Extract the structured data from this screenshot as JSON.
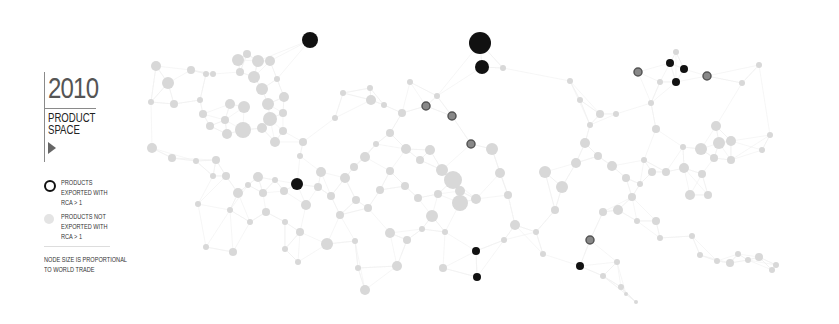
{
  "panel": {
    "year": "2010",
    "title": "PRODUCT\nSPACE",
    "play_icon": "play-triangle-icon"
  },
  "legend": {
    "items": [
      {
        "label": "PRODUCTS\nEXPORTED WITH\nRCA > 1",
        "style": "dark-ring"
      },
      {
        "label": "PRODUCTS NOT\nEXPORTED WITH\nRCA > 1",
        "style": "light-dot"
      }
    ],
    "note": "NODE SIZE IS PROPORTIONAL\nTO WORLD TRADE"
  },
  "colors": {
    "exported": "#111111",
    "exported_mid": "#555555",
    "not_exported": "#d8d8d8",
    "edge": "#f0f0f0",
    "text": "#333333"
  },
  "graph": {
    "exported_nodes": [
      {
        "x": 310,
        "y": 40,
        "r": 8
      },
      {
        "x": 480,
        "y": 43,
        "r": 11
      },
      {
        "x": 482,
        "y": 67,
        "r": 7
      },
      {
        "x": 670,
        "y": 63,
        "r": 4
      },
      {
        "x": 684,
        "y": 69,
        "r": 4
      },
      {
        "x": 676,
        "y": 82,
        "r": 4
      },
      {
        "x": 297,
        "y": 184,
        "r": 6
      },
      {
        "x": 476,
        "y": 251,
        "r": 4
      },
      {
        "x": 477,
        "y": 277,
        "r": 4
      },
      {
        "x": 580,
        "y": 266,
        "r": 4
      }
    ],
    "ring_nodes": [
      {
        "x": 638,
        "y": 72,
        "r": 4
      },
      {
        "x": 707,
        "y": 76,
        "r": 4
      },
      {
        "x": 426,
        "y": 106,
        "r": 4
      },
      {
        "x": 452,
        "y": 116,
        "r": 4
      },
      {
        "x": 471,
        "y": 144,
        "r": 4
      },
      {
        "x": 590,
        "y": 240,
        "r": 4
      }
    ],
    "light_nodes": [
      {
        "x": 156,
        "y": 66,
        "r": 5
      },
      {
        "x": 168,
        "y": 83,
        "r": 6
      },
      {
        "x": 191,
        "y": 70,
        "r": 4
      },
      {
        "x": 206,
        "y": 74,
        "r": 3
      },
      {
        "x": 213,
        "y": 74,
        "r": 3
      },
      {
        "x": 238,
        "y": 60,
        "r": 6
      },
      {
        "x": 247,
        "y": 54,
        "r": 4
      },
      {
        "x": 258,
        "y": 61,
        "r": 6
      },
      {
        "x": 270,
        "y": 61,
        "r": 5
      },
      {
        "x": 240,
        "y": 72,
        "r": 4
      },
      {
        "x": 254,
        "y": 77,
        "r": 6
      },
      {
        "x": 262,
        "y": 89,
        "r": 6
      },
      {
        "x": 277,
        "y": 79,
        "r": 3
      },
      {
        "x": 284,
        "y": 97,
        "r": 5
      },
      {
        "x": 230,
        "y": 104,
        "r": 5
      },
      {
        "x": 244,
        "y": 107,
        "r": 6
      },
      {
        "x": 268,
        "y": 104,
        "r": 6
      },
      {
        "x": 270,
        "y": 119,
        "r": 7
      },
      {
        "x": 283,
        "y": 113,
        "r": 4
      },
      {
        "x": 225,
        "y": 120,
        "r": 4
      },
      {
        "x": 243,
        "y": 130,
        "r": 8
      },
      {
        "x": 262,
        "y": 128,
        "r": 5
      },
      {
        "x": 227,
        "y": 134,
        "r": 5
      },
      {
        "x": 283,
        "y": 131,
        "r": 4
      },
      {
        "x": 275,
        "y": 142,
        "r": 5
      },
      {
        "x": 200,
        "y": 100,
        "r": 3
      },
      {
        "x": 174,
        "y": 104,
        "r": 4
      },
      {
        "x": 151,
        "y": 102,
        "r": 3
      },
      {
        "x": 152,
        "y": 148,
        "r": 5
      },
      {
        "x": 172,
        "y": 158,
        "r": 4
      },
      {
        "x": 203,
        "y": 114,
        "r": 4
      },
      {
        "x": 210,
        "y": 126,
        "r": 4
      },
      {
        "x": 196,
        "y": 161,
        "r": 3
      },
      {
        "x": 213,
        "y": 176,
        "r": 3
      },
      {
        "x": 216,
        "y": 160,
        "r": 4
      },
      {
        "x": 226,
        "y": 176,
        "r": 4
      },
      {
        "x": 238,
        "y": 193,
        "r": 5
      },
      {
        "x": 248,
        "y": 185,
        "r": 3
      },
      {
        "x": 258,
        "y": 177,
        "r": 5
      },
      {
        "x": 263,
        "y": 193,
        "r": 4
      },
      {
        "x": 275,
        "y": 180,
        "r": 3
      },
      {
        "x": 284,
        "y": 191,
        "r": 4
      },
      {
        "x": 306,
        "y": 205,
        "r": 5
      },
      {
        "x": 318,
        "y": 187,
        "r": 4
      },
      {
        "x": 321,
        "y": 172,
        "r": 5
      },
      {
        "x": 331,
        "y": 196,
        "r": 4
      },
      {
        "x": 345,
        "y": 178,
        "r": 5
      },
      {
        "x": 354,
        "y": 167,
        "r": 4
      },
      {
        "x": 365,
        "y": 157,
        "r": 5
      },
      {
        "x": 376,
        "y": 144,
        "r": 3
      },
      {
        "x": 371,
        "y": 100,
        "r": 5
      },
      {
        "x": 384,
        "y": 105,
        "r": 3
      },
      {
        "x": 402,
        "y": 113,
        "r": 4
      },
      {
        "x": 390,
        "y": 133,
        "r": 4
      },
      {
        "x": 406,
        "y": 149,
        "r": 5
      },
      {
        "x": 420,
        "y": 160,
        "r": 4
      },
      {
        "x": 430,
        "y": 150,
        "r": 5
      },
      {
        "x": 442,
        "y": 170,
        "r": 6
      },
      {
        "x": 453,
        "y": 180,
        "r": 9
      },
      {
        "x": 460,
        "y": 191,
        "r": 5
      },
      {
        "x": 460,
        "y": 203,
        "r": 8
      },
      {
        "x": 476,
        "y": 199,
        "r": 5
      },
      {
        "x": 492,
        "y": 149,
        "r": 6
      },
      {
        "x": 500,
        "y": 173,
        "r": 5
      },
      {
        "x": 508,
        "y": 195,
        "r": 4
      },
      {
        "x": 515,
        "y": 225,
        "r": 5
      },
      {
        "x": 438,
        "y": 194,
        "r": 4
      },
      {
        "x": 432,
        "y": 216,
        "r": 6
      },
      {
        "x": 418,
        "y": 198,
        "r": 4
      },
      {
        "x": 405,
        "y": 186,
        "r": 4
      },
      {
        "x": 390,
        "y": 171,
        "r": 4
      },
      {
        "x": 380,
        "y": 190,
        "r": 4
      },
      {
        "x": 368,
        "y": 208,
        "r": 4
      },
      {
        "x": 356,
        "y": 200,
        "r": 4
      },
      {
        "x": 340,
        "y": 215,
        "r": 4
      },
      {
        "x": 327,
        "y": 244,
        "r": 6
      },
      {
        "x": 300,
        "y": 232,
        "r": 4
      },
      {
        "x": 285,
        "y": 222,
        "r": 3
      },
      {
        "x": 266,
        "y": 212,
        "r": 4
      },
      {
        "x": 250,
        "y": 222,
        "r": 3
      },
      {
        "x": 230,
        "y": 210,
        "r": 3
      },
      {
        "x": 198,
        "y": 204,
        "r": 3
      },
      {
        "x": 206,
        "y": 247,
        "r": 3
      },
      {
        "x": 233,
        "y": 252,
        "r": 4
      },
      {
        "x": 285,
        "y": 249,
        "r": 3
      },
      {
        "x": 298,
        "y": 262,
        "r": 3
      },
      {
        "x": 355,
        "y": 241,
        "r": 3
      },
      {
        "x": 390,
        "y": 233,
        "r": 5
      },
      {
        "x": 407,
        "y": 240,
        "r": 4
      },
      {
        "x": 422,
        "y": 229,
        "r": 3
      },
      {
        "x": 445,
        "y": 232,
        "r": 3
      },
      {
        "x": 397,
        "y": 266,
        "r": 5
      },
      {
        "x": 365,
        "y": 290,
        "r": 5
      },
      {
        "x": 358,
        "y": 268,
        "r": 3
      },
      {
        "x": 443,
        "y": 268,
        "r": 4
      },
      {
        "x": 504,
        "y": 240,
        "r": 3
      },
      {
        "x": 536,
        "y": 232,
        "r": 3
      },
      {
        "x": 543,
        "y": 254,
        "r": 3
      },
      {
        "x": 555,
        "y": 210,
        "r": 4
      },
      {
        "x": 545,
        "y": 172,
        "r": 6
      },
      {
        "x": 562,
        "y": 187,
        "r": 6
      },
      {
        "x": 576,
        "y": 163,
        "r": 5
      },
      {
        "x": 585,
        "y": 143,
        "r": 5
      },
      {
        "x": 598,
        "y": 156,
        "r": 4
      },
      {
        "x": 612,
        "y": 166,
        "r": 5
      },
      {
        "x": 626,
        "y": 178,
        "r": 4
      },
      {
        "x": 632,
        "y": 197,
        "r": 4
      },
      {
        "x": 640,
        "y": 184,
        "r": 3
      },
      {
        "x": 644,
        "y": 160,
        "r": 3
      },
      {
        "x": 652,
        "y": 172,
        "r": 4
      },
      {
        "x": 666,
        "y": 172,
        "r": 4
      },
      {
        "x": 684,
        "y": 168,
        "r": 5
      },
      {
        "x": 702,
        "y": 174,
        "r": 4
      },
      {
        "x": 701,
        "y": 149,
        "r": 6
      },
      {
        "x": 716,
        "y": 126,
        "r": 5
      },
      {
        "x": 719,
        "y": 143,
        "r": 6
      },
      {
        "x": 731,
        "y": 141,
        "r": 5
      },
      {
        "x": 714,
        "y": 158,
        "r": 4
      },
      {
        "x": 731,
        "y": 160,
        "r": 4
      },
      {
        "x": 708,
        "y": 195,
        "r": 4
      },
      {
        "x": 690,
        "y": 195,
        "r": 5
      },
      {
        "x": 683,
        "y": 147,
        "r": 3
      },
      {
        "x": 656,
        "y": 129,
        "r": 4
      },
      {
        "x": 603,
        "y": 212,
        "r": 4
      },
      {
        "x": 618,
        "y": 210,
        "r": 5
      },
      {
        "x": 637,
        "y": 221,
        "r": 3
      },
      {
        "x": 656,
        "y": 221,
        "r": 4
      },
      {
        "x": 660,
        "y": 238,
        "r": 3
      },
      {
        "x": 692,
        "y": 236,
        "r": 3
      },
      {
        "x": 700,
        "y": 255,
        "r": 3
      },
      {
        "x": 717,
        "y": 261,
        "r": 3
      },
      {
        "x": 730,
        "y": 263,
        "r": 4
      },
      {
        "x": 738,
        "y": 254,
        "r": 3
      },
      {
        "x": 748,
        "y": 260,
        "r": 3
      },
      {
        "x": 759,
        "y": 257,
        "r": 4
      },
      {
        "x": 776,
        "y": 265,
        "r": 3
      },
      {
        "x": 772,
        "y": 270,
        "r": 3
      },
      {
        "x": 621,
        "y": 287,
        "r": 3
      },
      {
        "x": 626,
        "y": 294,
        "r": 2
      },
      {
        "x": 636,
        "y": 302,
        "r": 2
      },
      {
        "x": 603,
        "y": 276,
        "r": 3
      },
      {
        "x": 617,
        "y": 262,
        "r": 3
      },
      {
        "x": 503,
        "y": 68,
        "r": 3
      },
      {
        "x": 437,
        "y": 96,
        "r": 3
      },
      {
        "x": 410,
        "y": 82,
        "r": 3
      },
      {
        "x": 370,
        "y": 88,
        "r": 3
      },
      {
        "x": 343,
        "y": 93,
        "r": 3
      },
      {
        "x": 335,
        "y": 118,
        "r": 3
      },
      {
        "x": 303,
        "y": 142,
        "r": 4
      },
      {
        "x": 300,
        "y": 156,
        "r": 3
      },
      {
        "x": 570,
        "y": 81,
        "r": 3
      },
      {
        "x": 580,
        "y": 100,
        "r": 3
      },
      {
        "x": 590,
        "y": 125,
        "r": 3
      },
      {
        "x": 600,
        "y": 114,
        "r": 4
      },
      {
        "x": 616,
        "y": 114,
        "r": 3
      },
      {
        "x": 651,
        "y": 103,
        "r": 3
      },
      {
        "x": 660,
        "y": 82,
        "r": 3
      },
      {
        "x": 676,
        "y": 52,
        "r": 3
      },
      {
        "x": 742,
        "y": 83,
        "r": 3
      },
      {
        "x": 759,
        "y": 65,
        "r": 3
      },
      {
        "x": 770,
        "y": 135,
        "r": 3
      },
      {
        "x": 762,
        "y": 150,
        "r": 3
      }
    ]
  }
}
